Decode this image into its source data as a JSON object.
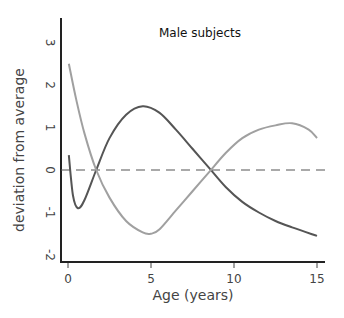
{
  "chart_data": {
    "type": "line",
    "title": "Male subjects",
    "xlabel": "Age (years)",
    "ylabel": "deviation from average",
    "xlim": [
      0,
      15
    ],
    "ylim": [
      -2,
      3
    ],
    "x_ticks": [
      "0",
      "5",
      "10",
      "15"
    ],
    "y_ticks": [
      "-2",
      "-1",
      "0",
      "1",
      "2",
      "3"
    ],
    "grid": false,
    "legend": null,
    "reference_line": {
      "y": 0,
      "style": "dashed"
    },
    "series": [
      {
        "name": "dark curve",
        "color": "#555555",
        "x": [
          0.05,
          0.3,
          0.6,
          1.0,
          1.7,
          2.5,
          3.5,
          4.5,
          5.5,
          6.5,
          7.5,
          8.5,
          9.5,
          10.5,
          11.5,
          12.5,
          13.5,
          15.0
        ],
        "y": [
          0.35,
          -0.6,
          -0.9,
          -0.7,
          0.0,
          0.75,
          1.3,
          1.5,
          1.35,
          0.95,
          0.5,
          0.05,
          -0.4,
          -0.75,
          -1.0,
          -1.2,
          -1.35,
          -1.55
        ]
      },
      {
        "name": "light curve",
        "color": "#a0a0a0",
        "x": [
          0.05,
          0.5,
          1.0,
          1.7,
          2.5,
          3.5,
          4.5,
          5.0,
          5.5,
          6.5,
          7.5,
          8.5,
          9.5,
          10.5,
          11.5,
          12.5,
          13.5,
          14.5,
          15.0
        ],
        "y": [
          2.5,
          1.65,
          0.85,
          0.0,
          -0.65,
          -1.2,
          -1.47,
          -1.5,
          -1.4,
          -0.95,
          -0.5,
          -0.05,
          0.4,
          0.75,
          0.95,
          1.05,
          1.1,
          0.95,
          0.75
        ]
      }
    ]
  }
}
